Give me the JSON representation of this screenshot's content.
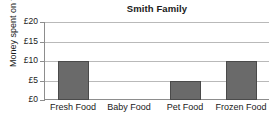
{
  "chart_data": {
    "type": "bar",
    "title": "Smith Family",
    "xlabel": "",
    "ylabel": "Money spent on food",
    "categories": [
      "Fresh Food",
      "Baby Food",
      "Pet Food",
      "Frozen Food"
    ],
    "values": [
      10,
      0,
      5,
      10
    ],
    "ylim": [
      0,
      20
    ],
    "ytick_values": [
      0,
      5,
      10,
      15,
      20
    ],
    "ytick_labels": [
      "£0",
      "£5",
      "£10",
      "£15",
      "£20"
    ],
    "currency_symbol": "£",
    "grid": true,
    "legend": false,
    "colors": {
      "bar_fill": "#6a6a6a",
      "bar_edge": "#4a4a4a",
      "gridline": "#b9b9b9",
      "axis": "#8d8d8d",
      "text": "#1a1a1a",
      "background": "#ffffff"
    }
  }
}
